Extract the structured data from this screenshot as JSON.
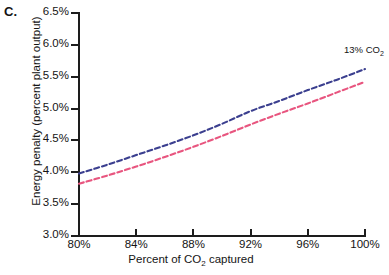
{
  "panel": {
    "label": "C."
  },
  "axes": {
    "ylabel": "Energy penalty (percent plant output)",
    "xlabel_pre": "Percent of CO",
    "xlabel_sub": "2",
    "xlabel_post": " captured",
    "yticks": [
      "6.5%",
      "6.0%",
      "5.5%",
      "5.0%",
      "4.5%",
      "4.0%",
      "3.5%",
      "3.0%"
    ],
    "xticks": [
      "80%",
      "84%",
      "88%",
      "92%",
      "96%",
      "100%"
    ]
  },
  "annotations": [
    {
      "text_pre": "13% CO",
      "text_sub": "2",
      "name": "co2-concentration-annotation"
    }
  ],
  "colors": {
    "series_blue": "#3b3f8f",
    "series_pink": "#e8557f",
    "axis": "#1d1d1d",
    "text": "#141414",
    "background": "#ffffff"
  },
  "chart_data": {
    "type": "line",
    "title": "",
    "subtitle": "",
    "xlabel": "Percent of CO2 captured",
    "ylabel": "Energy penalty (percent plant output)",
    "xlim": [
      80,
      100
    ],
    "ylim": [
      3.0,
      6.5
    ],
    "xtick_values": [
      80,
      84,
      88,
      92,
      96,
      100
    ],
    "ytick_values": [
      3.0,
      3.5,
      4.0,
      4.5,
      5.0,
      5.5,
      6.0,
      6.5
    ],
    "xtick_labels": [
      "80%",
      "84%",
      "88%",
      "92%",
      "96%",
      "100%"
    ],
    "ytick_labels": [
      "3.0%",
      "3.5%",
      "4.0%",
      "4.5%",
      "5.0%",
      "5.5%",
      "6.0%",
      "6.5%"
    ],
    "grid": false,
    "legend": "none",
    "annotation_text": "13% CO2",
    "x": [
      80,
      82,
      84,
      86,
      88,
      90,
      92,
      94,
      96,
      98,
      100
    ],
    "series": [
      {
        "name": "upper-curve",
        "color": "#3b3f8f",
        "style": "dashed",
        "values": [
          3.98,
          4.12,
          4.27,
          4.42,
          4.58,
          4.76,
          4.96,
          5.12,
          5.29,
          5.45,
          5.62
        ]
      },
      {
        "name": "lower-curve",
        "color": "#e8557f",
        "style": "dashed",
        "values": [
          3.82,
          3.95,
          4.09,
          4.24,
          4.4,
          4.57,
          4.75,
          4.92,
          5.08,
          5.25,
          5.42
        ]
      }
    ]
  }
}
